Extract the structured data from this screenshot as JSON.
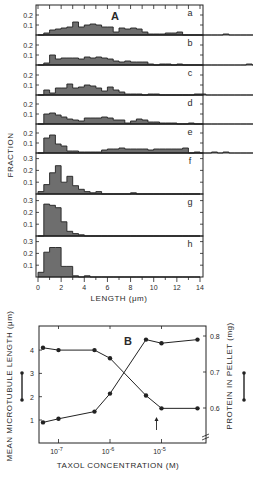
{
  "colors": {
    "ink": "#222222",
    "bar_fill": "#555555",
    "background": "#ffffff"
  },
  "chart_data": [
    {
      "type": "bar",
      "title": "A",
      "subtitle": "Length histograms (stacked panels a–h)",
      "xlabel": "LENGTH (µm)",
      "ylabel": "FRACTION",
      "xlim": [
        0,
        14
      ],
      "xticks": [
        0,
        2,
        4,
        6,
        8,
        10,
        12,
        14
      ],
      "bin_width": 0.5,
      "grid": false,
      "panels": [
        {
          "label": "a",
          "ylim": [
            0,
            0.25
          ],
          "yticks": [
            0.1,
            0.2
          ],
          "values": [
            0.0,
            0.02,
            0.05,
            0.06,
            0.07,
            0.08,
            0.13,
            0.08,
            0.1,
            0.11,
            0.1,
            0.08,
            0.08,
            0.03,
            0.07,
            0.06,
            0.07,
            0.06,
            0.03,
            0.01,
            0.01,
            0.01,
            0.02,
            0.02,
            0.03,
            0,
            0,
            0,
            0,
            0,
            0,
            0,
            0.01,
            0,
            0,
            0,
            0,
            0
          ]
        },
        {
          "label": "b",
          "ylim": [
            0,
            0.25
          ],
          "yticks": [
            0.1,
            0.2
          ],
          "values": [
            0.0,
            0.02,
            0.1,
            0.06,
            0.07,
            0.07,
            0.07,
            0.06,
            0.08,
            0.07,
            0.08,
            0.07,
            0.06,
            0.04,
            0.03,
            0.04,
            0.03,
            0.03,
            0.03,
            0.01,
            0,
            0.01,
            0.01,
            0,
            0.01,
            0,
            0,
            0,
            0,
            0,
            0,
            0,
            0,
            0,
            0,
            0,
            0.01,
            0
          ]
        },
        {
          "label": "c",
          "ylim": [
            0,
            0.25
          ],
          "yticks": [
            0.1,
            0.2
          ],
          "values": [
            0.0,
            0.05,
            0.02,
            0.07,
            0.07,
            0.11,
            0.07,
            0.08,
            0.1,
            0.09,
            0.07,
            0.04,
            0.08,
            0.05,
            0.03,
            0.01,
            0.01,
            0.01,
            0,
            0.01,
            0.01,
            0,
            0,
            0,
            0,
            0,
            0,
            0.01,
            0.01,
            0,
            0,
            0,
            0,
            0,
            0,
            0,
            0,
            0
          ]
        },
        {
          "label": "d",
          "ylim": [
            0,
            0.25
          ],
          "yticks": [
            0.1,
            0.2
          ],
          "values": [
            0.0,
            0.1,
            0.11,
            0.09,
            0.07,
            0.05,
            0.04,
            0.03,
            0.06,
            0.06,
            0.06,
            0.07,
            0.06,
            0.04,
            0.04,
            0.01,
            0.03,
            0.05,
            0.04,
            0.02,
            0.02,
            0.01,
            0.01,
            0.01,
            0,
            0,
            0.01,
            0,
            0,
            0,
            0,
            0,
            0,
            0,
            0,
            0,
            0,
            0
          ]
        },
        {
          "label": "e",
          "ylim": [
            0,
            0.25
          ],
          "yticks": [
            0.1,
            0.2
          ],
          "values": [
            0.0,
            0.15,
            0.18,
            0.09,
            0.07,
            0.02,
            0.02,
            0.01,
            0.01,
            0.01,
            0.01,
            0.03,
            0.04,
            0.04,
            0.05,
            0.04,
            0.04,
            0.04,
            0.04,
            0.03,
            0.04,
            0.04,
            0.04,
            0.04,
            0.04,
            0.05,
            0,
            0.01,
            0,
            0,
            0.01,
            0,
            0.01,
            0,
            0,
            0,
            0,
            0
          ]
        },
        {
          "label": "f",
          "ylim": [
            0,
            0.35
          ],
          "yticks": [
            0.1,
            0.2,
            0.3
          ],
          "values": [
            0.02,
            0.08,
            0.18,
            0.24,
            0.1,
            0.15,
            0.07,
            0.04,
            0.02,
            0.01,
            0.02,
            0,
            0,
            0,
            0,
            0,
            0.01,
            0,
            0,
            0,
            0,
            0,
            0,
            0,
            0,
            0,
            0,
            0
          ]
        },
        {
          "label": "g",
          "ylim": [
            0,
            0.35
          ],
          "yticks": [
            0.1,
            0.2,
            0.3
          ],
          "values": [
            0.0,
            0.27,
            0.26,
            0.24,
            0.12,
            0.04,
            0.02,
            0.01,
            0,
            0,
            0,
            0,
            0,
            0,
            0,
            0,
            0,
            0,
            0,
            0,
            0,
            0,
            0,
            0,
            0,
            0,
            0,
            0
          ]
        },
        {
          "label": "h",
          "ylim": [
            0,
            0.35
          ],
          "yticks": [
            0.1,
            0.2,
            0.3
          ],
          "values": [
            0.04,
            0.21,
            0.25,
            0.25,
            0.09,
            0.09,
            0.01,
            0,
            0.01,
            0,
            0,
            0,
            0,
            0,
            0,
            0,
            0,
            0,
            0,
            0,
            0,
            0,
            0,
            0,
            0,
            0,
            0,
            0
          ]
        }
      ]
    },
    {
      "type": "line",
      "title": "B",
      "xlabel": "TAXOL CONCENTRATION (M)",
      "ylabel": "MEAN MICROTUBULE LENGTH (µm)",
      "ylabel_right": "PROTEIN IN PELLET (mg)",
      "xscale": "log",
      "x": [
        5e-08,
        1e-07,
        5e-07,
        1e-06,
        5e-06,
        1e-05,
        5e-05
      ],
      "xtick_labels": [
        "10-7",
        "10-6",
        "10-5"
      ],
      "xticks": [
        1e-07,
        1e-06,
        1e-05
      ],
      "ylim": [
        0.2,
        4.7
      ],
      "yticks": [
        1,
        2,
        3,
        4
      ],
      "ylim_right": [
        0.52,
        0.84
      ],
      "yticks_right": [
        0.6,
        0.7,
        0.8
      ],
      "grid": false,
      "series": [
        {
          "name": "Mean microtubule length",
          "axis": "left",
          "values": [
            4.1,
            4.0,
            4.0,
            3.65,
            2.05,
            1.5,
            1.5
          ]
        },
        {
          "name": "Protein in pellet",
          "axis": "right",
          "values": [
            0.56,
            0.57,
            0.59,
            0.64,
            0.79,
            0.78,
            0.79
          ]
        }
      ],
      "annotations": [
        {
          "type": "arrow",
          "x": 8e-06,
          "direction": "up"
        },
        {
          "type": "axis-break",
          "axis": "right",
          "position": "bottom"
        }
      ]
    }
  ],
  "panel_a": {
    "letter": "A",
    "ylabel": "FRACTION",
    "xlabel": "LENGTH (μm)",
    "xtick_labels": [
      "0",
      "2",
      "4",
      "6",
      "8",
      "10",
      "12",
      "14"
    ]
  },
  "panel_b": {
    "letter": "B",
    "ylabel_left": "MEAN MICROTUBULE LENGTH (μm)",
    "ylabel_right": "PROTEIN IN PELLET (mg)",
    "xlabel": "TAXOL CONCENTRATION (M)",
    "ytick_labels_left": [
      "1",
      "2",
      "3",
      "4"
    ],
    "ytick_labels_right": [
      "0.6",
      "0.7",
      "0.8"
    ]
  }
}
